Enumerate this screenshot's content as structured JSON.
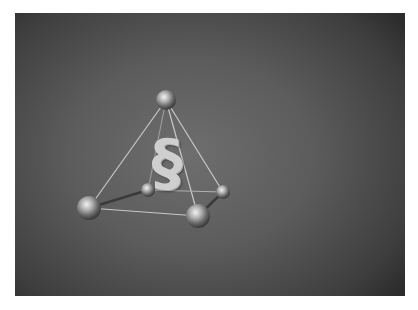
{
  "image": {
    "description": "Grayscale photo of a tetrahedral frame of metallic spheres connected by thin rods, with a white section sign inside, on a dark textured background",
    "symbol": "§",
    "colors": {
      "page_background": "#ffffff",
      "photo_center": "#6e6e6e",
      "photo_edge": "#2c2c2c",
      "symbol": "#cfcfcf",
      "rod": "#c8c8c8"
    },
    "spheres": [
      {
        "name": "top",
        "cx": 151,
        "cy": 87,
        "r": 10
      },
      {
        "name": "front-left",
        "cx": 74,
        "cy": 195,
        "r": 12
      },
      {
        "name": "back-left",
        "cx": 133,
        "cy": 177,
        "r": 7
      },
      {
        "name": "back-right",
        "cx": 208,
        "cy": 179,
        "r": 7
      },
      {
        "name": "front-right",
        "cx": 183,
        "cy": 203,
        "r": 12
      }
    ]
  }
}
